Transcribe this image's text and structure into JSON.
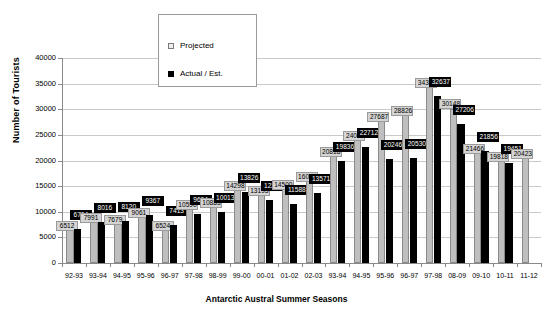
{
  "chart_data": {
    "type": "bar",
    "title": "",
    "xlabel": "Antarctic Austral Summer Seasons",
    "ylabel": "Number of Tourists",
    "ylim": [
      0,
      40000
    ],
    "ytick_labels": [
      "0",
      "5000",
      "10000",
      "15000",
      "20000",
      "25000",
      "30000",
      "35000",
      "40000"
    ],
    "ytick_values": [
      0,
      5000,
      10000,
      15000,
      20000,
      25000,
      30000,
      35000,
      40000
    ],
    "grid": true,
    "legend_position": "top-center-overlay",
    "categories": [
      "92-93",
      "93-94",
      "94-95",
      "95-96",
      "96-97",
      "97-98",
      "98-99",
      "99-00",
      "00-01",
      "01-02",
      "02-03",
      "93-94",
      "94-95",
      "95-96",
      "96-97",
      "97-98",
      "08-09",
      "09-10",
      "10-11",
      "11-12"
    ],
    "series": [
      {
        "name": "Projected",
        "color": "#bfbfbf",
        "values": [
          6512,
          7991,
          7679,
          9061,
          6524,
          10590,
          10883,
          14298,
          13193,
          14500,
          16000,
          20818,
          24000,
          27687,
          28826,
          34354,
          30148,
          21466,
          19818,
          20423
        ]
      },
      {
        "name": "Actual / Est.",
        "color": "#000000",
        "values": [
          6704,
          8016,
          8120,
          9367,
          7413,
          9604,
          10013,
          13826,
          12248,
          11588,
          13571,
          19836,
          22712,
          20246,
          20530,
          32637,
          27206,
          21856,
          19451,
          null
        ]
      }
    ]
  },
  "legend": {
    "items": [
      {
        "label": "Projected",
        "swatch": "projected-swatch"
      },
      {
        "label": "Actual / Est.",
        "swatch": "actual-swatch"
      }
    ]
  }
}
